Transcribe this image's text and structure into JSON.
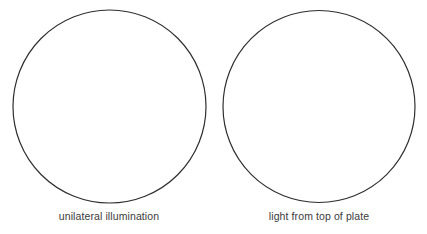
{
  "diagram": {
    "panels": [
      {
        "id": "left",
        "caption": "unilateral illumination",
        "shape": "circle",
        "cx": 109.5,
        "cy": 106.5,
        "r": 96.5
      },
      {
        "id": "right",
        "caption": "light from top of plate",
        "shape": "circle",
        "cx": 319,
        "cy": 106.5,
        "r": 96
      }
    ],
    "stroke_color": "#2e2e2e",
    "fill_color": "#ffffff",
    "background": "#ffffff"
  }
}
